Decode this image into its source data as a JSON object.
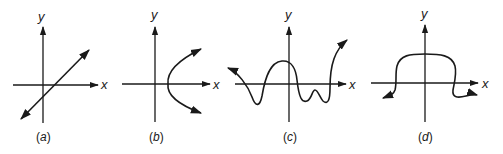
{
  "figure": {
    "axis_labels": {
      "x": "x",
      "y": "y"
    },
    "panels": [
      {
        "id": "a",
        "caption_open": "(",
        "caption_letter": "a",
        "caption_close": ")",
        "curve": "straight line with positive slope, arrows at both ends"
      },
      {
        "id": "b",
        "caption_open": "(",
        "caption_letter": "b",
        "caption_close": ")",
        "curve": "sideways parabola opening right, arrows at both ends"
      },
      {
        "id": "c",
        "caption_open": "(",
        "caption_letter": "c",
        "caption_close": ")",
        "curve": "oscillating wave curve, arrows at both ends"
      },
      {
        "id": "d",
        "caption_open": "(",
        "caption_letter": "d",
        "caption_close": ")",
        "curve": "plateau-shaped curve, arrows at both ends"
      }
    ],
    "colors": {
      "ink": "#1a1a1a",
      "background": "#ffffff"
    }
  }
}
